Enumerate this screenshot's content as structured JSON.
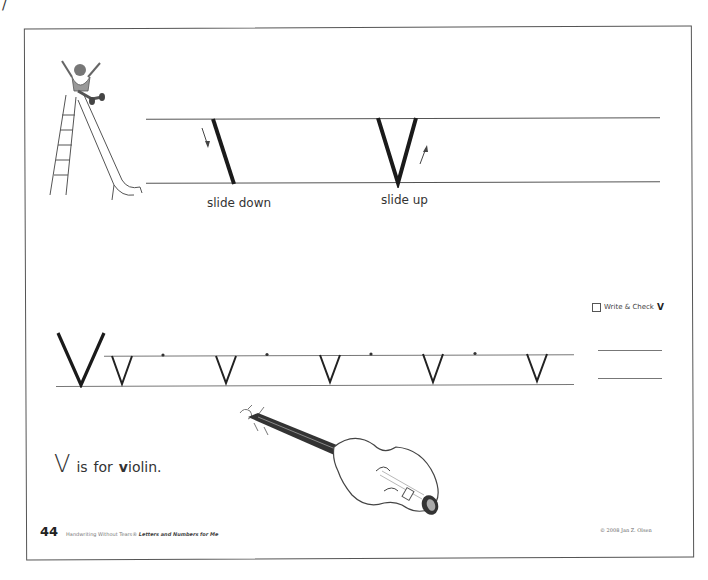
{
  "corner_mark": "/",
  "top_section": {
    "illustration": "child-on-slide",
    "strokes": [
      {
        "label": "slide down",
        "arrow": "down-right"
      },
      {
        "label": "slide up",
        "arrow": "up-right"
      }
    ]
  },
  "practice": {
    "model_letter": "V",
    "letters": [
      "V",
      "V",
      "V",
      "V",
      "V"
    ],
    "write_check": {
      "label": "Write & Check",
      "letter": "V",
      "checked": false
    }
  },
  "sentence": {
    "big_letter": "V",
    "text_is": "is",
    "text_for": "for",
    "word_bold_start": "v",
    "word_rest": "iolin."
  },
  "illustration_bottom": "violin",
  "footer": {
    "page_number": "44",
    "publisher": "Handwriting Without Tears®",
    "book_title": "Letters and Numbers for Me",
    "copyright": "© 2008 Jan Z. Olsen"
  },
  "colors": {
    "ink": "#222222",
    "line": "#555555",
    "paper": "#ffffff"
  }
}
